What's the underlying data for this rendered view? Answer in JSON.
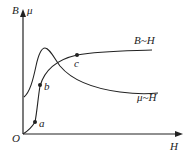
{
  "diagram": {
    "axes": {
      "y_label_left": "B",
      "y_label_right": "μ",
      "x_label": "H",
      "origin_label": "O"
    },
    "curves": [
      {
        "name": "B-H curve",
        "label": "B~H"
      },
      {
        "name": "mu-H curve",
        "label": "μ~H"
      }
    ],
    "points": [
      {
        "label": "a"
      },
      {
        "label": "b"
      },
      {
        "label": "c"
      }
    ],
    "colors": {
      "ink": "#222222",
      "background": "#ffffff"
    }
  }
}
